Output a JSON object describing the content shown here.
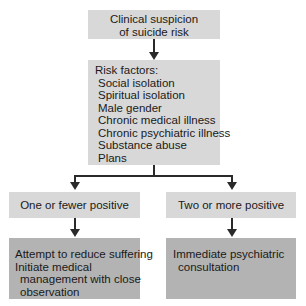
{
  "diagram": {
    "start": {
      "lines": [
        "Clinical suspicion",
        "of suicide risk"
      ]
    },
    "risk_factors": {
      "heading": "Risk factors:",
      "items": [
        "Social isolation",
        "Spiritual isolation",
        "Male gender",
        "Chronic medical illness",
        "Chronic psychiatric illness",
        "Substance abuse",
        "Plans"
      ]
    },
    "branches": [
      {
        "condition": "One or fewer positive",
        "action_lines": [
          "Attempt to reduce suffering",
          "Initiate medical",
          "management with close",
          "observation"
        ]
      },
      {
        "condition": "Two or more positive",
        "action_lines": [
          "Immediate psychiatric",
          "consultation"
        ]
      }
    ],
    "colors": {
      "box_light": "#d8d8d8",
      "box_dark": "#b3b3b3",
      "connector": "#2a2a2a"
    }
  }
}
